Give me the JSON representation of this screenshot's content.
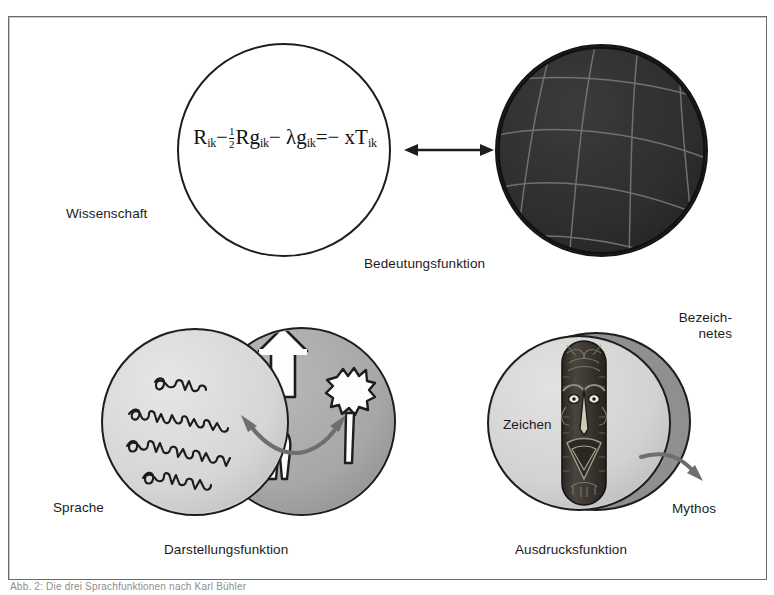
{
  "figure": {
    "caption": "Abb. 2: Die drei Sprachfunktionen nach Karl Bühler",
    "frame_color": "#6a6a6a",
    "background": "#ffffff"
  },
  "formula": {
    "name": "einstein-field-equation",
    "text": "R_ik − ½ R g_ik − λ g_ik = − x T_ik",
    "terms": {
      "r": "R",
      "sub1": "ik",
      "minus": "−",
      "half_num": "1",
      "half_den": "2",
      "rg": "Rg",
      "lambda": "λ",
      "g": "g",
      "equals": "=",
      "x": "x",
      "t": "T"
    }
  },
  "labels": {
    "wissenschaft": "Wissenschaft",
    "bedeutungsfunktion": "Bedeutungsfunktion",
    "sprache": "Sprache",
    "darstellungsfunktion": "Darstellungsfunktion",
    "zeichen": "Zeichen",
    "bezeichnetes": "Bezeich-\nnetes",
    "mythos": "Mythos",
    "ausdrucksfunktion": "Ausdrucksfunktion"
  },
  "colors": {
    "outline": "#1d1d1d",
    "sphere_dark": "#2f2f2f",
    "sphere_grid": "#7c7c7c",
    "circle_light": "#d7d7d7",
    "circle_mid": "#a9a9a9",
    "circle_dark": "#8f8f8f",
    "mask_dark": "#3a3733",
    "arrow_gray": "#6e6e6e",
    "text": "#1b1b1b"
  },
  "icons": {
    "double_arrow": "double-headed-arrow",
    "curved_arrow_left": "curved-arrow-left",
    "curved_arrow_right": "curved-arrow-right",
    "mythos_arrow": "curved-arrow-right",
    "up_arrow": "up-arrow-silhouette",
    "person": "person-silhouette",
    "tree": "tree-silhouette",
    "mask": "tribal-mask",
    "handwriting": "handwritten-script-lines",
    "grid_sphere": "curved-spacetime-grid"
  }
}
